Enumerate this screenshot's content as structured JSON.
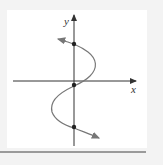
{
  "figure": {
    "type": "graph",
    "x_axis_label": "x",
    "y_axis_label": "y",
    "colors": {
      "axis": "#333333",
      "curve": "#777777",
      "points": "#222222",
      "background": "#ffffff",
      "frame": "#f3f3f3",
      "rule": "#9a9a9a"
    },
    "points": [
      {
        "label": "y-intercept-top",
        "px": 74,
        "py": 44
      },
      {
        "label": "y-intercept-middle",
        "px": 74,
        "py": 85
      },
      {
        "label": "y-intercept-bottom",
        "px": 74,
        "py": 127
      }
    ]
  }
}
